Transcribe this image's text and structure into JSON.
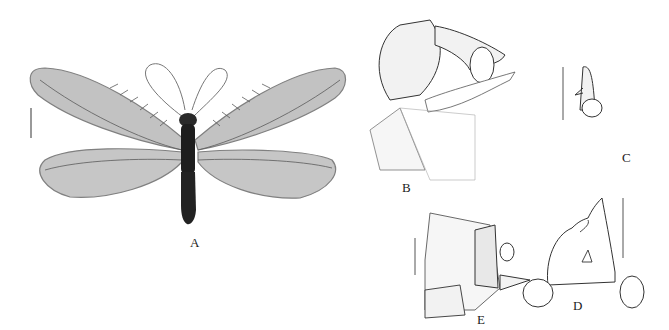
{
  "figure": {
    "panels": [
      {
        "id": "A",
        "label": "A",
        "description": "habitus, dorsal view"
      },
      {
        "id": "B",
        "label": "B",
        "description": "male terminalia, lateral view"
      },
      {
        "id": "C",
        "label": "C",
        "description": "ectoproct detail"
      },
      {
        "id": "D",
        "label": "D",
        "description": "genitalia, dorsal view"
      },
      {
        "id": "E",
        "label": "E",
        "description": "female terminalia, lateral view"
      }
    ],
    "colors": {
      "ink": "#222222",
      "wing": "#8a8a8a",
      "body": "#1e1e1e"
    }
  }
}
